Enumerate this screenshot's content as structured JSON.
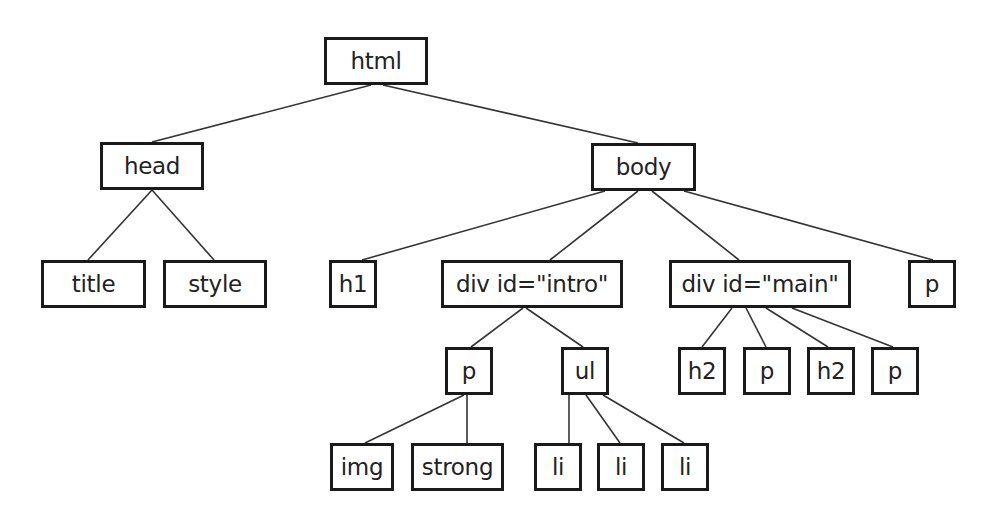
{
  "diagram": {
    "type": "tree",
    "title": "",
    "colors": {
      "background": "#ffffff",
      "stroke": "#1a1a1a",
      "text": "#222222",
      "edge": "#333333"
    },
    "nodes": [
      {
        "id": "html",
        "label": "html",
        "x": 324,
        "y": 37,
        "w": 104,
        "h": 48
      },
      {
        "id": "head",
        "label": "head",
        "x": 100,
        "y": 142,
        "w": 104,
        "h": 48
      },
      {
        "id": "body",
        "label": "body",
        "x": 591,
        "y": 143,
        "w": 105,
        "h": 48
      },
      {
        "id": "title",
        "label": "title",
        "x": 41,
        "y": 260,
        "w": 105,
        "h": 48
      },
      {
        "id": "style",
        "label": "style",
        "x": 163,
        "y": 260,
        "w": 104,
        "h": 48
      },
      {
        "id": "h1",
        "label": "h1",
        "x": 329,
        "y": 260,
        "w": 48,
        "h": 48
      },
      {
        "id": "div-intro",
        "label": "div id=\"intro\"",
        "x": 441,
        "y": 260,
        "w": 182,
        "h": 48
      },
      {
        "id": "div-main",
        "label": "div id=\"main\"",
        "x": 669,
        "y": 260,
        "w": 182,
        "h": 48
      },
      {
        "id": "p-body",
        "label": "p",
        "x": 908,
        "y": 260,
        "w": 48,
        "h": 48
      },
      {
        "id": "p-intro",
        "label": "p",
        "x": 445,
        "y": 347,
        "w": 48,
        "h": 48
      },
      {
        "id": "ul",
        "label": "ul",
        "x": 561,
        "y": 347,
        "w": 48,
        "h": 48
      },
      {
        "id": "h2-a",
        "label": "h2",
        "x": 678,
        "y": 347,
        "w": 48,
        "h": 48
      },
      {
        "id": "p-main-a",
        "label": "p",
        "x": 743,
        "y": 347,
        "w": 48,
        "h": 48
      },
      {
        "id": "h2-b",
        "label": "h2",
        "x": 807,
        "y": 347,
        "w": 48,
        "h": 48
      },
      {
        "id": "p-main-b",
        "label": "p",
        "x": 871,
        "y": 347,
        "w": 48,
        "h": 48
      },
      {
        "id": "img",
        "label": "img",
        "x": 330,
        "y": 443,
        "w": 64,
        "h": 48
      },
      {
        "id": "strong",
        "label": "strong",
        "x": 411,
        "y": 443,
        "w": 93,
        "h": 48
      },
      {
        "id": "li-1",
        "label": "li",
        "x": 534,
        "y": 443,
        "w": 48,
        "h": 48
      },
      {
        "id": "li-2",
        "label": "li",
        "x": 597,
        "y": 443,
        "w": 48,
        "h": 48
      },
      {
        "id": "li-3",
        "label": "li",
        "x": 661,
        "y": 443,
        "w": 48,
        "h": 48
      }
    ],
    "edges": [
      {
        "from": "html",
        "to": "head",
        "x1": 371,
        "y1": 85,
        "x2": 152,
        "y2": 142
      },
      {
        "from": "html",
        "to": "body",
        "x1": 383,
        "y1": 85,
        "x2": 638,
        "y2": 143
      },
      {
        "from": "head",
        "to": "title",
        "x1": 152,
        "y1": 190,
        "x2": 88,
        "y2": 260
      },
      {
        "from": "head",
        "to": "style",
        "x1": 152,
        "y1": 190,
        "x2": 214,
        "y2": 260
      },
      {
        "from": "body",
        "to": "h1",
        "x1": 605,
        "y1": 191,
        "x2": 362,
        "y2": 260
      },
      {
        "from": "body",
        "to": "div-intro",
        "x1": 638,
        "y1": 191,
        "x2": 550,
        "y2": 260
      },
      {
        "from": "body",
        "to": "div-main",
        "x1": 652,
        "y1": 191,
        "x2": 739,
        "y2": 260
      },
      {
        "from": "body",
        "to": "p-body",
        "x1": 684,
        "y1": 191,
        "x2": 933,
        "y2": 260
      },
      {
        "from": "div-intro",
        "to": "p-intro",
        "x1": 523,
        "y1": 308,
        "x2": 471,
        "y2": 347
      },
      {
        "from": "div-intro",
        "to": "ul",
        "x1": 526,
        "y1": 308,
        "x2": 583,
        "y2": 347
      },
      {
        "from": "div-main",
        "to": "h2-a",
        "x1": 732,
        "y1": 308,
        "x2": 702,
        "y2": 347
      },
      {
        "from": "div-main",
        "to": "p-main-a",
        "x1": 746,
        "y1": 308,
        "x2": 766,
        "y2": 347
      },
      {
        "from": "div-main",
        "to": "h2-b",
        "x1": 766,
        "y1": 308,
        "x2": 828,
        "y2": 347
      },
      {
        "from": "div-main",
        "to": "p-main-b",
        "x1": 792,
        "y1": 308,
        "x2": 893,
        "y2": 347
      },
      {
        "from": "p-intro",
        "to": "img",
        "x1": 464,
        "y1": 395,
        "x2": 365,
        "y2": 443
      },
      {
        "from": "p-intro",
        "to": "strong",
        "x1": 467,
        "y1": 395,
        "x2": 467,
        "y2": 443
      },
      {
        "from": "ul",
        "to": "li-1",
        "x1": 569,
        "y1": 395,
        "x2": 569,
        "y2": 443
      },
      {
        "from": "ul",
        "to": "li-2",
        "x1": 586,
        "y1": 395,
        "x2": 620,
        "y2": 443
      },
      {
        "from": "ul",
        "to": "li-3",
        "x1": 603,
        "y1": 395,
        "x2": 684,
        "y2": 443
      }
    ]
  }
}
